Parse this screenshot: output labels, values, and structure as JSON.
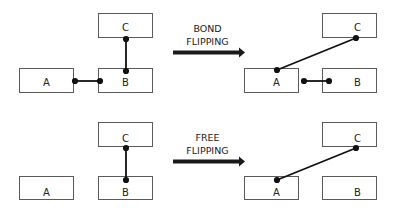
{
  "diagram": {
    "rows": [
      {
        "name": "bond-flipping",
        "arrow_label_line1": "BOND",
        "arrow_label_line2": "FLIPPING",
        "before": {
          "A": "A",
          "B": "B",
          "C": "C"
        },
        "after": {
          "A": "A",
          "B": "B",
          "C": "C"
        }
      },
      {
        "name": "free-flipping",
        "arrow_label_line1": "FREE",
        "arrow_label_line2": "FLIPPING",
        "before": {
          "A": "A",
          "B": "B",
          "C": "C"
        },
        "after": {
          "A": "A",
          "B": "B",
          "C": "C"
        }
      }
    ],
    "colors": {
      "box_border": "#5a5a5a",
      "bond": "#111111",
      "arrow": "#1a1a1a"
    }
  }
}
